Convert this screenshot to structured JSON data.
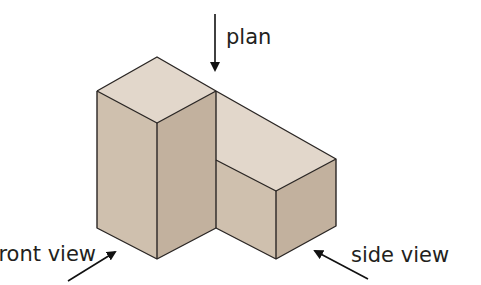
{
  "diagram": {
    "labels": {
      "plan": "plan",
      "front_view": "front view",
      "side_view": "side view"
    },
    "colors": {
      "top_face": "#e2d7cb",
      "left_face": "#cfc0ae",
      "right_face": "#c2b19e",
      "edge": "#2a2624",
      "arrow": "#111111",
      "text": "#231f20"
    }
  }
}
